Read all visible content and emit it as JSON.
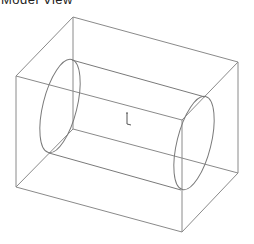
{
  "header": {
    "title": "Model View"
  },
  "view": {
    "line_color": "#8a8a8a",
    "box": {
      "front_top_left": [
        16,
        76
      ],
      "front_top_right": [
        182,
        120
      ],
      "front_bottom_left": [
        16,
        187
      ],
      "front_bottom_right": [
        182,
        232
      ],
      "back_top_left": [
        73,
        17
      ],
      "back_top_right": [
        238,
        62
      ],
      "back_bottom_left": [
        73,
        129
      ],
      "back_bottom_right": [
        238,
        173
      ]
    },
    "cylinder": {
      "left_cap": {
        "cx": 60,
        "cy": 106,
        "rx": 17,
        "ry": 48,
        "rotate": 14
      },
      "right_cap": {
        "cx": 194,
        "cy": 143,
        "rx": 17,
        "ry": 48,
        "rotate": 14
      }
    },
    "origin_marker": {
      "x": 128,
      "y": 122,
      "icon": "axis-triad-icon"
    }
  }
}
